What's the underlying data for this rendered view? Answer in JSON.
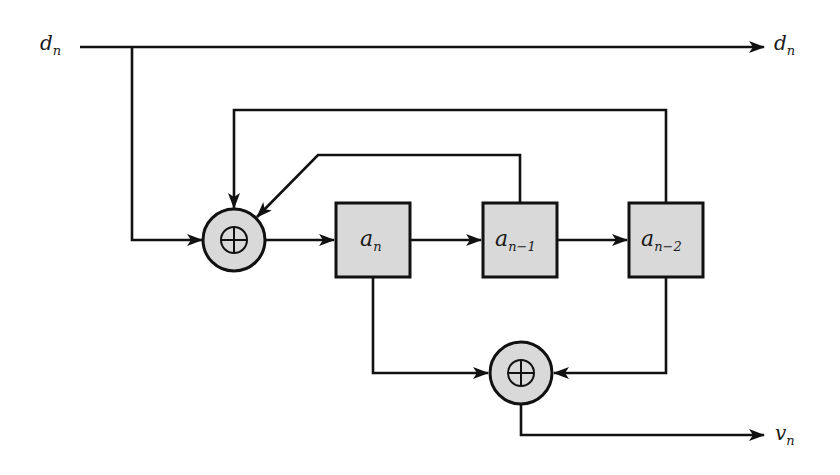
{
  "diagram": {
    "type": "shift-register convolutional encoder block diagram",
    "colors": {
      "line": "#111111",
      "fill": "#d9d9d9",
      "background": "#ffffff"
    },
    "input": {
      "label": "d",
      "subscript": "n"
    },
    "outputs": [
      {
        "id": "data-out",
        "label": "d",
        "subscript": "n"
      },
      {
        "id": "parity-out",
        "label": "v",
        "subscript": "n"
      }
    ],
    "registers": [
      {
        "id": "reg-a-n",
        "label": "a",
        "subscript": "n"
      },
      {
        "id": "reg-a-n-1",
        "label": "a",
        "subscript": "n−1"
      },
      {
        "id": "reg-a-n-2",
        "label": "a",
        "subscript": "n−2"
      }
    ],
    "adders": [
      {
        "id": "feedback-adder",
        "symbol": "⊕"
      },
      {
        "id": "output-adder",
        "symbol": "⊕"
      }
    ],
    "connections": [
      "d_n -> d_n (output)",
      "d_n -> feedback-adder",
      "a_n-1 -> feedback-adder",
      "a_n-2 -> feedback-adder",
      "feedback-adder -> a_n",
      "a_n -> a_n-1",
      "a_n-1 -> a_n-2",
      "a_n -> output-adder",
      "a_n-2 -> output-adder",
      "output-adder -> v_n"
    ]
  }
}
